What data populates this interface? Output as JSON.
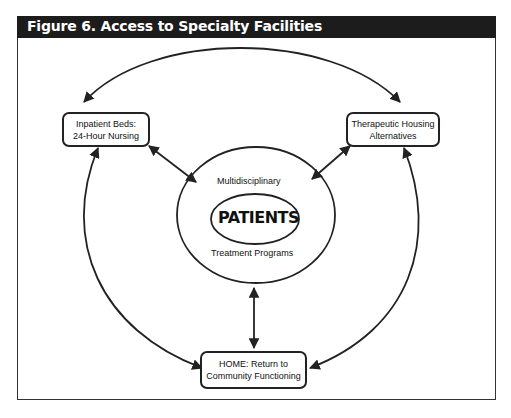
{
  "figure": {
    "title": "Figure 6.  Access to Specialty Facilities"
  },
  "nodes": {
    "inpatient": {
      "line1": "Inpatient Beds:",
      "line2": "24-Hour Nursing"
    },
    "housing": {
      "line1": "Therapeutic Housing",
      "line2": "Alternatives"
    },
    "home": {
      "line1": "HOME: Return to",
      "line2": "Community Functioning"
    },
    "center": {
      "top_label": "Multidisciplinary",
      "core_label": "PATIENTS",
      "bottom_label": "Treatment Programs"
    }
  },
  "edges": [
    {
      "from": "inpatient",
      "to": "housing",
      "type": "bidirectional-arc"
    },
    {
      "from": "inpatient",
      "to": "home",
      "type": "bidirectional-arc"
    },
    {
      "from": "housing",
      "to": "home",
      "type": "bidirectional-arc"
    },
    {
      "from": "inpatient",
      "to": "center",
      "type": "bidirectional"
    },
    {
      "from": "housing",
      "to": "center",
      "type": "bidirectional"
    },
    {
      "from": "home",
      "to": "center",
      "type": "bidirectional"
    }
  ],
  "colors": {
    "header_bg": "#1c1c1c",
    "header_text": "#ffffff",
    "line": "#222222"
  }
}
